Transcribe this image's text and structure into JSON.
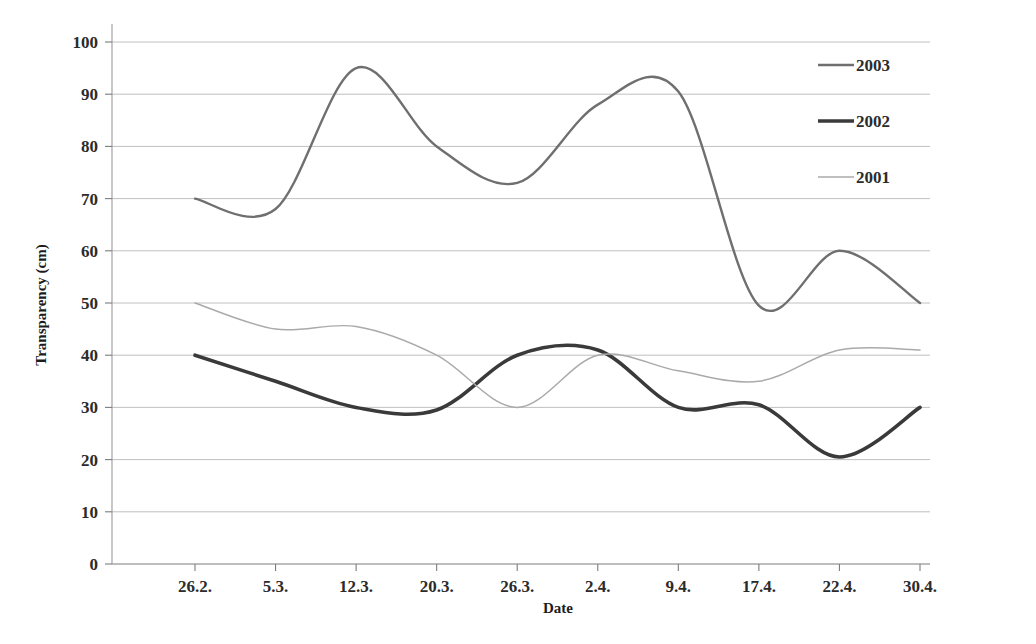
{
  "chart_data": {
    "type": "line",
    "title": "",
    "xlabel": "Date",
    "ylabel": "Transparency (cm)",
    "categories": [
      "26.2.",
      "5.3.",
      "12.3.",
      "20.3.",
      "26.3.",
      "2.4.",
      "9.4.",
      "17.4.",
      "22.4.",
      "30.4."
    ],
    "x_tick_labels": [
      "26.2.",
      "5.3.",
      "12.3.",
      "20.3.",
      "26.3.",
      "2.4.",
      "9.4.",
      "17.4.",
      "22.4.",
      "30.4."
    ],
    "y_tick_labels": [
      "0",
      "10",
      "20",
      "30",
      "40",
      "50",
      "60",
      "70",
      "80",
      "90",
      "100"
    ],
    "y_ticks": [
      0,
      10,
      20,
      30,
      40,
      50,
      60,
      70,
      80,
      90,
      100
    ],
    "ylim": [
      0,
      100
    ],
    "grid": "horizontal",
    "legend_position": "top-right",
    "smoothing": "spline",
    "series": [
      {
        "name": "2003",
        "color": "#6f6f6f",
        "width": 2.4,
        "values": [
          70,
          68,
          95,
          80,
          73,
          88,
          90.5,
          49.5,
          60,
          50
        ]
      },
      {
        "name": "2002",
        "color": "#3a3a3a",
        "width": 3.6,
        "values": [
          40,
          35,
          30,
          29.5,
          40,
          41,
          30,
          30.5,
          20.5,
          30
        ]
      },
      {
        "name": "2001",
        "color": "#aaaaaa",
        "width": 1.5,
        "values": [
          50,
          45,
          45.5,
          40,
          30,
          40,
          37,
          35,
          41,
          41
        ]
      }
    ]
  },
  "legend": {
    "entries": [
      {
        "label": "2003"
      },
      {
        "label": "2002"
      },
      {
        "label": "2001"
      }
    ]
  },
  "axes": {
    "x_title": "Date",
    "y_title": "Transparency (cm)"
  }
}
